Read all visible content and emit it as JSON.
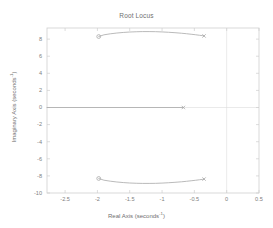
{
  "chart_data": {
    "type": "line",
    "title": "Root Locus",
    "xlabel_text": "Real Axis (seconds",
    "xlabel_exp": "-1",
    "xlabel_tail": ")",
    "ylabel_text": "Imaginary Axis (seconds",
    "ylabel_exp": "-1",
    "ylabel_tail": ")",
    "xlim": [
      -2.78,
      0.5
    ],
    "ylim": [
      -10.0,
      9.3
    ],
    "xticks": [
      -2.5,
      -2,
      -1.5,
      -1,
      -0.5,
      0,
      0.5
    ],
    "xticklabels": [
      "-2.5",
      "-2",
      "-1.5",
      "-1",
      "-0.5",
      "0",
      "0.5"
    ],
    "yticks": [
      8,
      6,
      4,
      2,
      0,
      -2,
      -4,
      -6,
      -8,
      -10
    ],
    "yticklabels": [
      "8",
      "6",
      "4",
      "2",
      "0",
      "-2",
      "-4",
      "-6",
      "-8",
      "-10"
    ],
    "grid": false,
    "legend": "none",
    "axis_color": "#cfcfcf",
    "locus_color": "#a8a8a8",
    "reference_line_color": "#dcdcdc",
    "series": [
      {
        "name": "upper-branch",
        "comment": "complex conjugate branch in upper half plane",
        "points": [
          [
            -1.98,
            8.3
          ],
          [
            -1.9,
            8.5
          ],
          [
            -1.8,
            8.62
          ],
          [
            -1.7,
            8.71
          ],
          [
            -1.6,
            8.78
          ],
          [
            -1.5,
            8.83
          ],
          [
            -1.4,
            8.86
          ],
          [
            -1.3,
            8.88
          ],
          [
            -1.2,
            8.88
          ],
          [
            -1.1,
            8.87
          ],
          [
            -1.0,
            8.84
          ],
          [
            -0.9,
            8.8
          ],
          [
            -0.8,
            8.75
          ],
          [
            -0.7,
            8.69
          ],
          [
            -0.62,
            8.63
          ],
          [
            -0.55,
            8.57
          ],
          [
            -0.48,
            8.51
          ],
          [
            -0.42,
            8.45
          ],
          [
            -0.38,
            8.41
          ],
          [
            -0.35,
            8.37
          ]
        ]
      },
      {
        "name": "lower-branch",
        "comment": "complex conjugate branch in lower half plane",
        "points": [
          [
            -1.98,
            -8.3
          ],
          [
            -1.9,
            -8.5
          ],
          [
            -1.8,
            -8.62
          ],
          [
            -1.7,
            -8.71
          ],
          [
            -1.6,
            -8.78
          ],
          [
            -1.5,
            -8.83
          ],
          [
            -1.4,
            -8.86
          ],
          [
            -1.3,
            -8.88
          ],
          [
            -1.2,
            -8.88
          ],
          [
            -1.1,
            -8.87
          ],
          [
            -1.0,
            -8.84
          ],
          [
            -0.9,
            -8.8
          ],
          [
            -0.8,
            -8.75
          ],
          [
            -0.7,
            -8.69
          ],
          [
            -0.62,
            -8.63
          ],
          [
            -0.55,
            -8.57
          ],
          [
            -0.48,
            -8.51
          ],
          [
            -0.42,
            -8.45
          ],
          [
            -0.38,
            -8.41
          ],
          [
            -0.35,
            -8.37
          ]
        ]
      },
      {
        "name": "real-axis-branch",
        "comment": "branch travelling along the real axis",
        "points": [
          [
            -2.78,
            0.0
          ],
          [
            -0.67,
            0.0
          ]
        ]
      }
    ],
    "markers": [
      {
        "name": "open-loop-zero-upper",
        "shape": "circle",
        "x": -1.98,
        "y": 8.3
      },
      {
        "name": "open-loop-pole-upper",
        "shape": "cross",
        "x": -0.35,
        "y": 8.37
      },
      {
        "name": "open-loop-zero-lower",
        "shape": "circle",
        "x": -1.98,
        "y": -8.3
      },
      {
        "name": "open-loop-pole-lower",
        "shape": "cross",
        "x": -0.35,
        "y": -8.37
      },
      {
        "name": "open-loop-pole-real",
        "shape": "cross",
        "x": -0.67,
        "y": 0.0
      }
    ],
    "reference_lines": [
      {
        "name": "imaginary-axis",
        "orientation": "vertical",
        "value": 0
      },
      {
        "name": "real-axis",
        "orientation": "horizontal",
        "value": 0
      }
    ]
  }
}
